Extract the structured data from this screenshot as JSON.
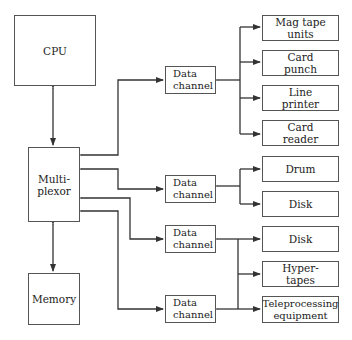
{
  "diagram": {
    "title": "",
    "nodes": {
      "cpu": "CPU",
      "multiplexor": "Multi-\nplexor",
      "memory": "Memory",
      "data_channels": [
        "Data\nchannel",
        "Data\nchannel",
        "Data\nchannel",
        "Data\nchannel"
      ],
      "devices": [
        "Mag tape\nunits",
        "Card\npunch",
        "Line\nprinter",
        "Card\nreader",
        "Drum",
        "Disk",
        "Disk",
        "Hyper-\ntapes",
        "Teleprocessing\nequipment"
      ]
    },
    "edges": [
      {
        "from": "CPU",
        "to": "Multiplexor",
        "type": "bidirectional"
      },
      {
        "from": "Multiplexor",
        "to": "Memory",
        "type": "bidirectional"
      },
      {
        "from": "Multiplexor",
        "to": "Data channel 1",
        "type": "bidirectional"
      },
      {
        "from": "Multiplexor",
        "to": "Data channel 2",
        "type": "bidirectional"
      },
      {
        "from": "Multiplexor",
        "to": "Data channel 3",
        "type": "bidirectional"
      },
      {
        "from": "Multiplexor",
        "to": "Data channel 4",
        "type": "bidirectional"
      },
      {
        "from": "Data channel 1",
        "to": [
          "Mag tape units",
          "Card punch",
          "Line printer",
          "Card reader"
        ]
      },
      {
        "from": "Data channel 2",
        "to": [
          "Drum",
          "Disk"
        ]
      },
      {
        "from": "Data channel 3",
        "to": [
          "Disk",
          "Hyper-tapes",
          "Teleprocessing equipment"
        ]
      },
      {
        "from": "Data channel 4",
        "to": [
          "Disk",
          "Hyper-tapes",
          "Teleprocessing equipment"
        ]
      }
    ],
    "colors": {
      "line": "#333333",
      "border": "#555555",
      "background": "#ffffff"
    }
  }
}
